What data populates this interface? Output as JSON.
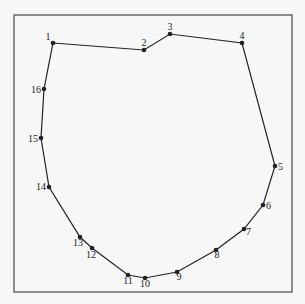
{
  "diagram": {
    "frame": {
      "x": 14,
      "y": 15,
      "width": 278,
      "height": 277,
      "stroke": "#555555"
    },
    "line_color": "#222222",
    "points": [
      {
        "label": "1",
        "x": 53,
        "y": 43,
        "lx": 48,
        "ly": 40,
        "anchor": "middle"
      },
      {
        "label": "2",
        "x": 144,
        "y": 50,
        "lx": 144,
        "ly": 46,
        "anchor": "middle"
      },
      {
        "label": "3",
        "x": 170,
        "y": 34,
        "lx": 170,
        "ly": 30,
        "anchor": "middle"
      },
      {
        "label": "4",
        "x": 242,
        "y": 43,
        "lx": 242,
        "ly": 39,
        "anchor": "middle"
      },
      {
        "label": "5",
        "x": 275,
        "y": 166,
        "lx": 278,
        "ly": 170,
        "anchor": "start"
      },
      {
        "label": "6",
        "x": 263,
        "y": 205,
        "lx": 266,
        "ly": 209,
        "anchor": "start"
      },
      {
        "label": "7",
        "x": 244,
        "y": 229,
        "lx": 246,
        "ly": 235,
        "anchor": "start"
      },
      {
        "label": "8",
        "x": 216,
        "y": 250,
        "lx": 217,
        "ly": 258,
        "anchor": "middle"
      },
      {
        "label": "9",
        "x": 177,
        "y": 272,
        "lx": 179,
        "ly": 280,
        "anchor": "middle"
      },
      {
        "label": "10",
        "x": 145,
        "y": 278,
        "lx": 145,
        "ly": 287,
        "anchor": "middle"
      },
      {
        "label": "11",
        "x": 128,
        "y": 275,
        "lx": 128,
        "ly": 284,
        "anchor": "middle"
      },
      {
        "label": "12",
        "x": 92,
        "y": 248,
        "lx": 91,
        "ly": 258,
        "anchor": "middle"
      },
      {
        "label": "13",
        "x": 80,
        "y": 237,
        "lx": 78,
        "ly": 246,
        "anchor": "middle"
      },
      {
        "label": "14",
        "x": 49,
        "y": 187,
        "lx": 46,
        "ly": 190,
        "anchor": "end"
      },
      {
        "label": "15",
        "x": 41,
        "y": 138,
        "lx": 38,
        "ly": 142,
        "anchor": "end"
      },
      {
        "label": "16",
        "x": 44,
        "y": 89,
        "lx": 41,
        "ly": 93,
        "anchor": "end"
      }
    ]
  }
}
